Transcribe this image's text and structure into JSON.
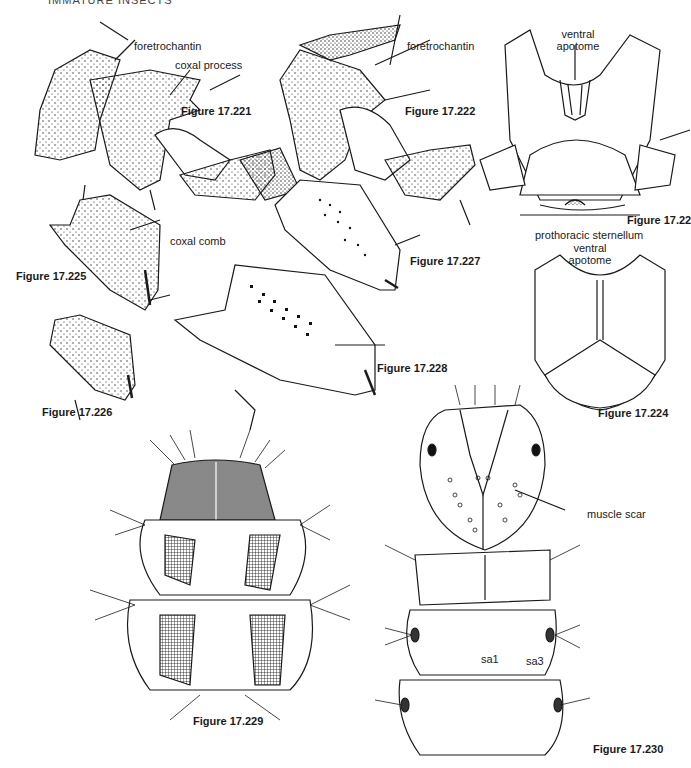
{
  "page": {
    "running_header": "IMMATURE INSECTS"
  },
  "figures": [
    {
      "id": "fig-17-221",
      "caption": "Figure 17.221",
      "labels": [
        "foretrochantin",
        "coxal process"
      ]
    },
    {
      "id": "fig-17-222",
      "caption": "Figure 17.222",
      "labels": [
        "foretrochantin"
      ]
    },
    {
      "id": "fig-17-223",
      "caption": "Figure 17.223",
      "labels": [
        "ventral apotome",
        "prothoracic sternellum"
      ]
    },
    {
      "id": "fig-17-224",
      "caption": "Figure 17.224",
      "labels": [
        "ventral apotome"
      ]
    },
    {
      "id": "fig-17-225",
      "caption": "Figure 17.225",
      "labels": [
        "coxal comb"
      ]
    },
    {
      "id": "fig-17-226",
      "caption": "Figure 17.226",
      "labels": []
    },
    {
      "id": "fig-17-227",
      "caption": "Figure 17.227",
      "labels": []
    },
    {
      "id": "fig-17-228",
      "caption": "Figure 17.228",
      "labels": []
    },
    {
      "id": "fig-17-229",
      "caption": "Figure 17.229",
      "labels": []
    },
    {
      "id": "fig-17-230",
      "caption": "Figure 17.230",
      "labels": [
        "muscle scar",
        "sa1",
        "sa3"
      ]
    }
  ],
  "captions": {
    "f221": "Figure 17.221",
    "f222": "Figure 17.222",
    "f223": "Figure 17.22",
    "f224": "Figure 17.224",
    "f225": "Figure 17.225",
    "f226": "Figure 17.226",
    "f227": "Figure 17.227",
    "f228": "Figure 17.228",
    "f229": "Figure 17.229",
    "f230": "Figure 17.230"
  },
  "labels": {
    "foretrochantin_221": "foretrochantin",
    "coxal_process": "coxal process",
    "foretrochantin_222": "foretrochantin",
    "ventral_apotome_223_l1": "ventral",
    "ventral_apotome_223_l2": "apotome",
    "prothoracic_sternellum": "prothoracic sternellum",
    "ventral_apotome_224_l1": "ventral",
    "ventral_apotome_224_l2": "apotome",
    "coxal_comb": "coxal comb",
    "muscle_scar": "muscle scar",
    "sa1": "sa1",
    "sa3": "sa3"
  },
  "colors": {
    "ink": "#1a1a1a",
    "paper": "#ffffff"
  }
}
